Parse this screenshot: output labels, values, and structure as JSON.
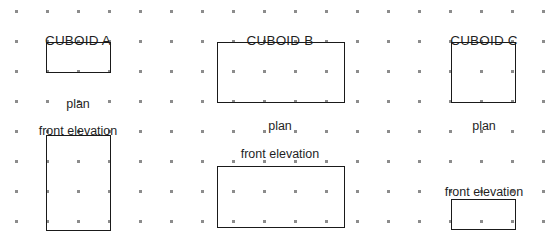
{
  "worksheet": {
    "type": "plan-and-elevation-drawing",
    "grid": {
      "style": "square-dot-grid",
      "dot_color": "#8c8c8c",
      "origin_x": 16,
      "origin_y": 11,
      "spacing_x": 31,
      "spacing_y": 30,
      "columns": 18,
      "rows": 8
    },
    "line_color": "#1a1a1a",
    "background_color": "#ffffff",
    "figures": [
      {
        "id": "cuboid-a",
        "title": "CUBOID A",
        "title_x": 78,
        "title_y": 34,
        "views": [
          {
            "name": "plan",
            "label": "plan",
            "label_x": 78,
            "label_y": 98,
            "rect": {
              "x": 46,
              "y": 42,
              "w": 65,
              "h": 31
            },
            "grid_units": {
              "w": 2,
              "h": 1
            }
          },
          {
            "name": "front elevation",
            "label": "front elevation",
            "label_x": 78,
            "label_y": 125,
            "rect": {
              "x": 46,
              "y": 135,
              "w": 65,
              "h": 96
            },
            "grid_units": {
              "w": 2,
              "h": 3
            }
          }
        ]
      },
      {
        "id": "cuboid-b",
        "title": "CUBOID B",
        "title_x": 280,
        "title_y": 34,
        "views": [
          {
            "name": "plan",
            "label": "plan",
            "label_x": 280,
            "label_y": 120,
            "rect": {
              "x": 217,
              "y": 42,
              "w": 128,
              "h": 61
            },
            "grid_units": {
              "w": 4,
              "h": 2
            }
          },
          {
            "name": "front elevation",
            "label": "front elevation",
            "label_x": 280,
            "label_y": 148,
            "rect": {
              "x": 217,
              "y": 166,
              "w": 128,
              "h": 62
            },
            "grid_units": {
              "w": 4,
              "h": 2
            }
          }
        ]
      },
      {
        "id": "cuboid-c",
        "title": "CUBOID C",
        "title_x": 484,
        "title_y": 34,
        "views": [
          {
            "name": "plan",
            "label": "plan",
            "label_x": 484,
            "label_y": 120,
            "rect": {
              "x": 451,
              "y": 42,
              "w": 65,
              "h": 61
            },
            "grid_units": {
              "w": 2,
              "h": 2
            }
          },
          {
            "name": "front elevation",
            "label": "front elevation",
            "label_x": 484,
            "label_y": 186,
            "rect": {
              "x": 451,
              "y": 199,
              "w": 65,
              "h": 31
            },
            "grid_units": {
              "w": 2,
              "h": 1
            }
          }
        ]
      }
    ]
  }
}
